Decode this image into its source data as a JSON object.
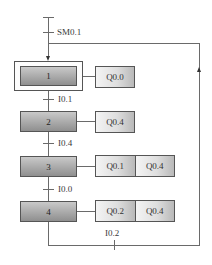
{
  "diagram": {
    "type": "sequential-function-chart",
    "initial_transition": {
      "label": "SM0.1"
    },
    "steps": [
      {
        "number": "1",
        "initial": true,
        "actions": [
          "Q0.0"
        ]
      },
      {
        "number": "2",
        "initial": false,
        "actions": [
          "Q0.4"
        ]
      },
      {
        "number": "3",
        "initial": false,
        "actions": [
          "Q0.1",
          "Q0.4"
        ]
      },
      {
        "number": "4",
        "initial": false,
        "actions": [
          "Q0.2",
          "Q0.4"
        ]
      }
    ],
    "transitions": [
      {
        "from": "1",
        "to": "2",
        "label": "I0.1"
      },
      {
        "from": "2",
        "to": "3",
        "label": "I0.4"
      },
      {
        "from": "3",
        "to": "4",
        "label": "I0.0"
      },
      {
        "from": "4",
        "to": "1",
        "label": "I0.2"
      }
    ],
    "colors": {
      "line": "#6a6a6a",
      "step_fill": "#a9a9a9",
      "action_fill": "#dedede"
    }
  }
}
